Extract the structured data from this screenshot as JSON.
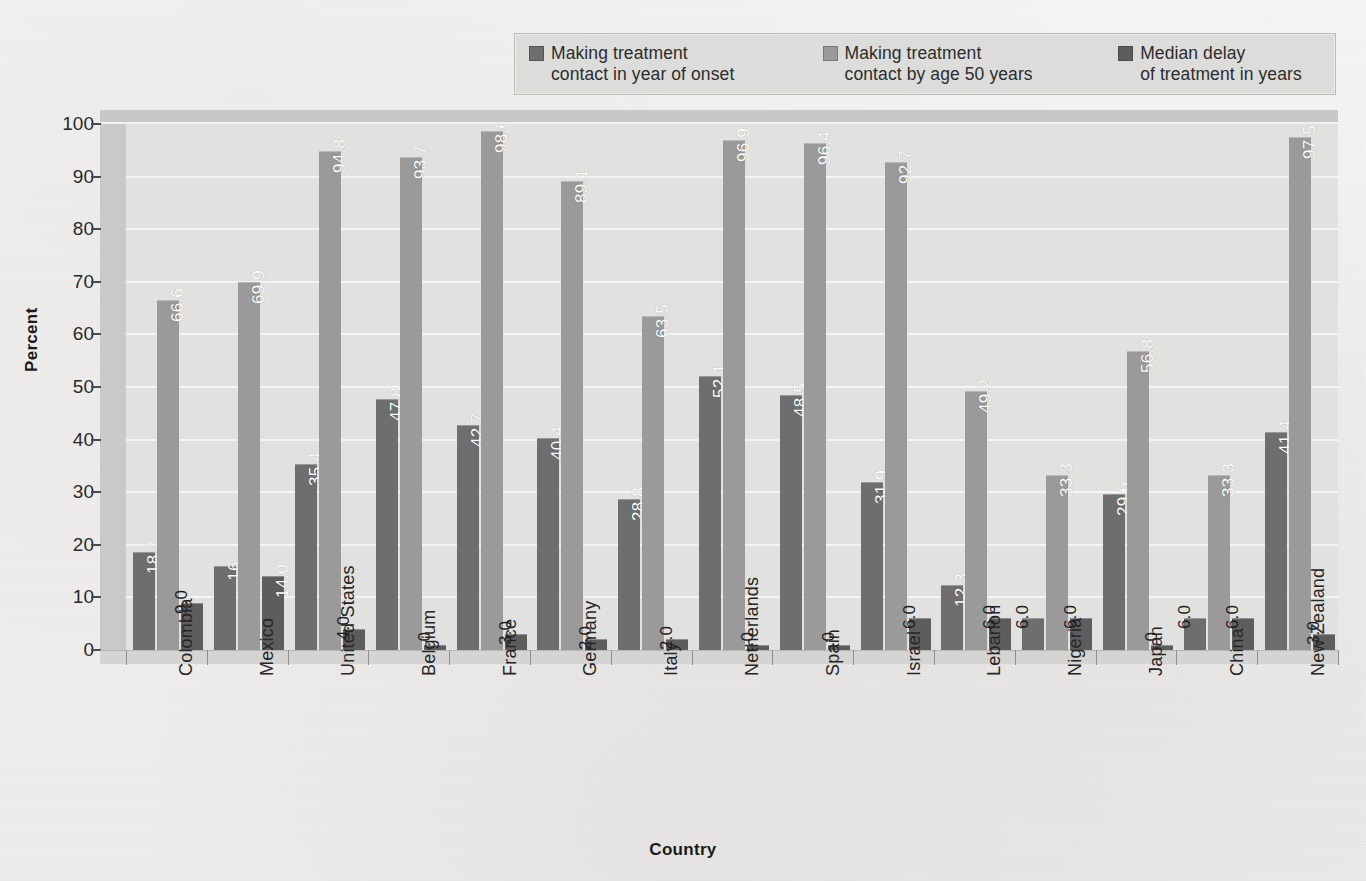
{
  "chart_data": {
    "type": "bar",
    "title": "",
    "xlabel": "Country",
    "ylabel": "Percent",
    "ylim": [
      0,
      100
    ],
    "ytick_labels": [
      "0",
      "10",
      "20",
      "30",
      "40",
      "50",
      "60",
      "70",
      "80",
      "90",
      "100"
    ],
    "grid": true,
    "legend_position": "top-center",
    "categories": [
      "Colombia",
      "Mexico",
      "United States",
      "Belgium",
      "France",
      "Germany",
      "Italy",
      "Netherlands",
      "Spain",
      "Israel",
      "Lebanon",
      "Nigeria",
      "Japan",
      "China",
      "New Zealand"
    ],
    "series": [
      {
        "name": "Making treatment\ncontact in year of onset",
        "color": "#6e6e6e",
        "values": [
          18.7,
          16,
          35.4,
          47.8,
          42.7,
          40.4,
          28.8,
          52.1,
          48.5,
          31.9,
          12.3,
          6.0,
          29.6,
          6.0,
          41.4
        ],
        "labels": [
          "18.7",
          "16",
          "35.4",
          "47.8",
          "42.7",
          "40.4",
          "28.8",
          "52.1",
          "48.5",
          "31.9",
          "12.3",
          "6.0",
          "29.6",
          "6.0",
          "41.4"
        ]
      },
      {
        "name": "Making treatment\ncontact by age 50 years",
        "color": "#9a9a9a",
        "values": [
          66.6,
          69.9,
          94.8,
          93.7,
          98.6,
          89.1,
          63.5,
          96.9,
          96.4,
          92.7,
          49.2,
          33.3,
          56.8,
          33.3,
          97.5
        ],
        "labels": [
          "66.6",
          "69.9",
          "94.8",
          "93.7",
          "98.6",
          "89.1",
          "63.5",
          "96.9",
          "96.4",
          "92.7",
          "49.2",
          "33.3",
          "56.8",
          "33.3",
          "97.5"
        ]
      },
      {
        "name": "Median delay\nof treatment in years",
        "color": "#5d5d5d",
        "values": [
          9.0,
          14.0,
          4.0,
          1.0,
          3.0,
          2.0,
          2.0,
          1.0,
          1.0,
          6.0,
          6.0,
          6.0,
          1.0,
          6.0,
          3.0
        ],
        "labels": [
          "9.0",
          "14.0",
          "4.0",
          "1.0",
          "3.0",
          "2.0",
          "2.0",
          "1.0",
          "1.0",
          "6.0",
          "6.0",
          "6.0",
          "1.0",
          "6.0",
          "3.0"
        ]
      }
    ]
  },
  "legend": {
    "items": [
      {
        "label": "Making treatment\ncontact in year of onset",
        "color": "#6e6e6e"
      },
      {
        "label": "Making treatment\ncontact by age 50 years",
        "color": "#9a9a9a"
      },
      {
        "label": "Median delay\nof treatment in years",
        "color": "#5d5d5d"
      }
    ]
  },
  "axes": {
    "y_title": "Percent",
    "x_title": "Country"
  }
}
